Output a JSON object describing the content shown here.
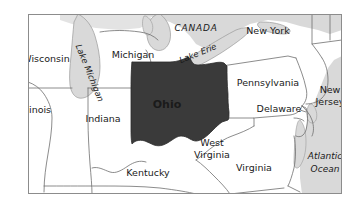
{
  "map": {
    "title": "Ohio location map",
    "frame": {
      "stroke": "#8c8c8c",
      "fill": "#ffffff"
    },
    "colors": {
      "highlight_state": "#3a3a3a",
      "highlight_label": "#ffffff",
      "land": "#ffffff",
      "water": "#d9d9d9",
      "border": "#6e6e6e",
      "water_border": "#9a9a9a",
      "label": "#1a1a1a",
      "page_background": "#ffffff"
    },
    "highlight": {
      "name": "Ohio",
      "label": "Ohio",
      "style": "bold",
      "fill": "#3a3a3a",
      "text_fill": "#ffffff"
    },
    "state_labels": [
      {
        "id": "wisconsin",
        "text": "Wisconsin",
        "x": 46,
        "y": 62,
        "size": 9.5,
        "style": "normal",
        "anchor": "middle",
        "rotate": 0
      },
      {
        "id": "michigan",
        "text": "Michigan",
        "x": 133,
        "y": 58,
        "size": 9.5,
        "style": "normal",
        "anchor": "middle",
        "rotate": 0
      },
      {
        "id": "new-york",
        "text": "New York",
        "x": 268,
        "y": 34,
        "size": 9.5,
        "style": "normal",
        "anchor": "middle",
        "rotate": 0
      },
      {
        "id": "pennsylvania",
        "text": "Pennsylvania",
        "x": 268,
        "y": 86,
        "size": 9.5,
        "style": "normal",
        "anchor": "middle",
        "rotate": 0
      },
      {
        "id": "illinois",
        "text": "Illinois",
        "x": 36,
        "y": 113,
        "size": 9.5,
        "style": "normal",
        "anchor": "middle",
        "rotate": 0
      },
      {
        "id": "indiana",
        "text": "Indiana",
        "x": 103,
        "y": 122,
        "size": 9.5,
        "style": "normal",
        "anchor": "middle",
        "rotate": 0
      },
      {
        "id": "kentucky",
        "text": "Kentucky",
        "x": 148,
        "y": 176,
        "size": 9.5,
        "style": "normal",
        "anchor": "middle",
        "rotate": 0
      },
      {
        "id": "west-virginia-1",
        "text": "West",
        "x": 212,
        "y": 146,
        "size": 9.5,
        "style": "normal",
        "anchor": "middle",
        "rotate": 0
      },
      {
        "id": "west-virginia-2",
        "text": "Virginia",
        "x": 212,
        "y": 158,
        "size": 9.5,
        "style": "normal",
        "anchor": "middle",
        "rotate": 0
      },
      {
        "id": "virginia",
        "text": "Virginia",
        "x": 254,
        "y": 171,
        "size": 9.5,
        "style": "normal",
        "anchor": "middle",
        "rotate": 0
      },
      {
        "id": "delaware",
        "text": "Delaware",
        "x": 279,
        "y": 112,
        "size": 9.5,
        "style": "normal",
        "anchor": "middle",
        "rotate": 0
      },
      {
        "id": "new-jersey-1",
        "text": "New",
        "x": 330,
        "y": 93,
        "size": 9.5,
        "style": "normal",
        "anchor": "middle",
        "rotate": 0
      },
      {
        "id": "new-jersey-2",
        "text": "Jersey",
        "x": 330,
        "y": 105,
        "size": 9.5,
        "style": "normal",
        "anchor": "middle",
        "rotate": 0
      }
    ],
    "water_labels": [
      {
        "id": "lake-michigan",
        "text": "Lake Michigan",
        "x": 87,
        "y": 74,
        "size": 8.5,
        "style": "italic",
        "anchor": "middle",
        "rotate": 68
      },
      {
        "id": "lake-erie",
        "text": "Lake Erie",
        "x": 199,
        "y": 56,
        "size": 8.5,
        "style": "italic",
        "anchor": "middle",
        "rotate": -22
      },
      {
        "id": "atlantic-1",
        "text": "Atlantic",
        "x": 325,
        "y": 159,
        "size": 9,
        "style": "italic",
        "anchor": "middle",
        "rotate": 0
      },
      {
        "id": "atlantic-2",
        "text": "Ocean",
        "x": 325,
        "y": 172,
        "size": 9,
        "style": "italic",
        "anchor": "middle",
        "rotate": 0
      }
    ],
    "country_labels": [
      {
        "id": "canada",
        "text": "CANADA",
        "x": 196,
        "y": 31,
        "size": 9,
        "style": "italic",
        "anchor": "middle",
        "rotate": 0,
        "letter_spacing": 0.8
      }
    ],
    "ohio_label": {
      "id": "ohio",
      "text": "Ohio",
      "x": 167,
      "y": 108,
      "size": 11,
      "style": "bold",
      "anchor": "middle"
    }
  }
}
